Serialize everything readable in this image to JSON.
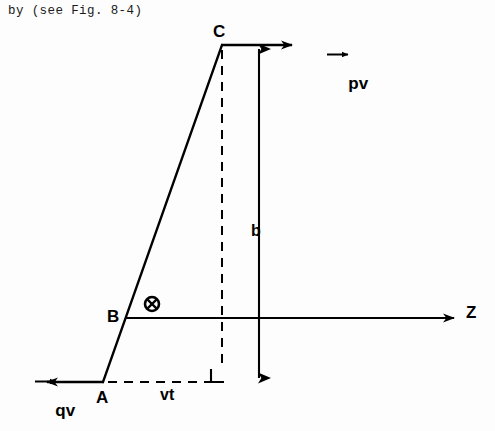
{
  "figure": {
    "caption": "by (see Fig. 8-4)",
    "background_color": "#fdfdfd",
    "stroke_color": "#000000",
    "points": [
      {
        "id": "C",
        "label": "C",
        "x": 222,
        "y": 45
      },
      {
        "id": "B",
        "label": "B",
        "x": 126,
        "y": 318
      },
      {
        "id": "A",
        "label": "A",
        "x": 103,
        "y": 382
      }
    ],
    "axis": {
      "label": "Z",
      "from_x": 126,
      "to_x": 455,
      "y": 318
    },
    "vectors": [
      {
        "id": "pv",
        "label": "pv",
        "symbol": "p",
        "subsymbol": "v",
        "overline": "vector-arrow",
        "direction": "right",
        "from_x": 222,
        "to_x": 293,
        "y": 45
      },
      {
        "id": "qv",
        "label": "qv",
        "symbol": "q",
        "subsymbol": "v",
        "overline": "vector-arrow",
        "direction": "left",
        "from_x": 103,
        "to_x": 46,
        "y": 382
      }
    ],
    "dimensions": [
      {
        "id": "b",
        "label": "b",
        "type": "double-headed-arrow",
        "orientation": "vertical",
        "x": 259,
        "from_y": 47,
        "to_y": 380
      },
      {
        "id": "vt",
        "label": "vt",
        "type": "dashed-segment",
        "orientation": "horizontal",
        "y": 382,
        "from_x": 108,
        "to_x": 222
      }
    ],
    "markers": [
      {
        "id": "into-page",
        "name": "circled-x-symbol",
        "x": 152,
        "y": 304,
        "radius": 7
      },
      {
        "id": "right-angle",
        "name": "right-angle-marker",
        "x": 211,
        "y": 366,
        "size": 13
      }
    ],
    "dashed_lines": [
      {
        "id": "c-drop",
        "x1": 222,
        "y1": 48,
        "x2": 222,
        "y2": 368
      }
    ],
    "solid_lines": [
      {
        "id": "trajectory",
        "x1": 222,
        "y1": 45,
        "x2": 103,
        "y2": 382
      }
    ]
  }
}
